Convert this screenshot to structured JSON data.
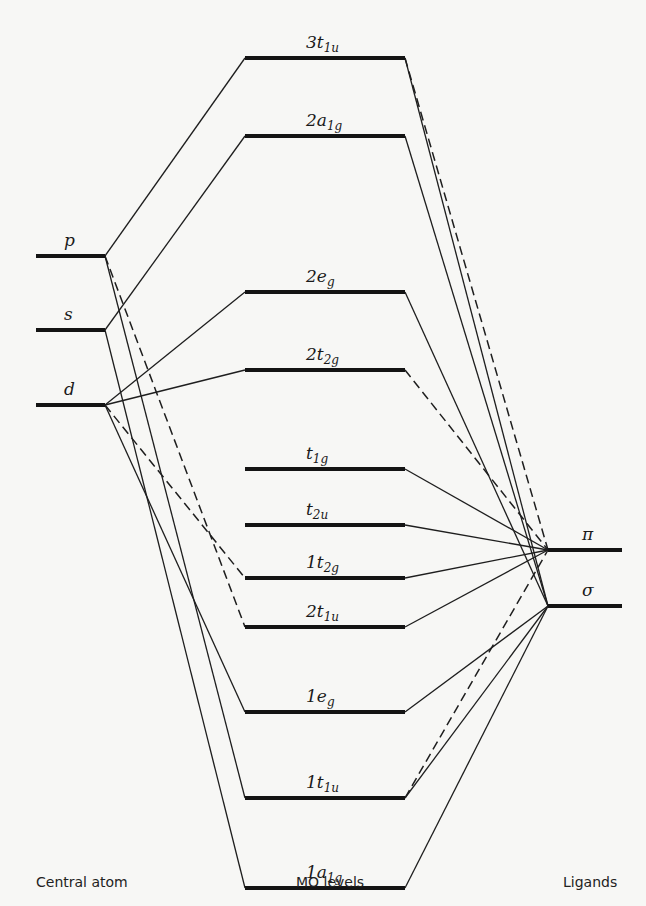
{
  "diagram": {
    "type": "molecular-orbital-energy-diagram",
    "columns": {
      "central_atom": "Central atom",
      "mo_levels": "MO levels",
      "ligands": "Ligands"
    },
    "central_atom_orbitals": [
      {
        "id": "p",
        "label": "p",
        "y": 256
      },
      {
        "id": "s",
        "label": "s",
        "y": 330
      },
      {
        "id": "d",
        "label": "d",
        "y": 405
      }
    ],
    "mo_levels": [
      {
        "id": "3t1u",
        "prefix": "3",
        "main": "t",
        "sub": "1u",
        "y": 58
      },
      {
        "id": "2a1g",
        "prefix": "2",
        "main": "a",
        "sub": "1g",
        "y": 136
      },
      {
        "id": "2eg",
        "prefix": "2",
        "main": "e",
        "sub": "g",
        "y": 292
      },
      {
        "id": "2t2g",
        "prefix": "2",
        "main": "t",
        "sub": "2g",
        "y": 370
      },
      {
        "id": "t1g",
        "prefix": "",
        "main": "t",
        "sub": "1g",
        "y": 469
      },
      {
        "id": "t2u",
        "prefix": "",
        "main": "t",
        "sub": "2u",
        "y": 525
      },
      {
        "id": "1t2g",
        "prefix": "1",
        "main": "t",
        "sub": "2g",
        "y": 578
      },
      {
        "id": "2t1u",
        "prefix": "2",
        "main": "t",
        "sub": "1u",
        "y": 627
      },
      {
        "id": "1eg",
        "prefix": "1",
        "main": "e",
        "sub": "g",
        "y": 712
      },
      {
        "id": "1t1u",
        "prefix": "1",
        "main": "t",
        "sub": "1u",
        "y": 798
      },
      {
        "id": "1a1g",
        "prefix": "1",
        "main": "a",
        "sub": "1g",
        "y": 888
      }
    ],
    "ligand_orbitals": [
      {
        "id": "pi",
        "label": "π",
        "y": 550
      },
      {
        "id": "sigma",
        "label": "σ",
        "y": 606
      }
    ],
    "left_connections": [
      {
        "from": "p",
        "to": "3t1u",
        "style": "solid"
      },
      {
        "from": "p",
        "to": "1t1u",
        "style": "solid"
      },
      {
        "from": "p",
        "to": "2t1u",
        "style": "dashed"
      },
      {
        "from": "s",
        "to": "2a1g",
        "style": "solid"
      },
      {
        "from": "s",
        "to": "1a1g",
        "style": "solid"
      },
      {
        "from": "d",
        "to": "2eg",
        "style": "solid"
      },
      {
        "from": "d",
        "to": "2t2g",
        "style": "solid"
      },
      {
        "from": "d",
        "to": "1t2g",
        "style": "dashed"
      },
      {
        "from": "d",
        "to": "1eg",
        "style": "solid"
      }
    ],
    "right_connections": [
      {
        "from": "3t1u",
        "to": "sigma",
        "style": "solid"
      },
      {
        "from": "3t1u",
        "to": "pi",
        "style": "dashed"
      },
      {
        "from": "2a1g",
        "to": "sigma",
        "style": "solid"
      },
      {
        "from": "2eg",
        "to": "sigma",
        "style": "solid"
      },
      {
        "from": "2t2g",
        "to": "pi",
        "style": "dashed"
      },
      {
        "from": "t1g",
        "to": "pi",
        "style": "solid"
      },
      {
        "from": "t2u",
        "to": "pi",
        "style": "solid"
      },
      {
        "from": "1t2g",
        "to": "pi",
        "style": "solid"
      },
      {
        "from": "2t1u",
        "to": "pi",
        "style": "solid"
      },
      {
        "from": "1eg",
        "to": "sigma",
        "style": "solid"
      },
      {
        "from": "1t1u",
        "to": "sigma",
        "style": "solid"
      },
      {
        "from": "1t1u",
        "to": "pi",
        "style": "dashed"
      },
      {
        "from": "1a1g",
        "to": "sigma",
        "style": "solid"
      }
    ]
  }
}
